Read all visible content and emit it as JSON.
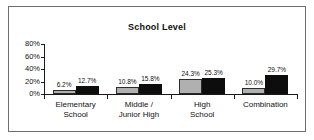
{
  "chart_data": {
    "type": "bar",
    "title": "School Level",
    "xlabel": "",
    "ylabel": "",
    "ylim": [
      0,
      80
    ],
    "grid": false,
    "legend": "none",
    "ytick_labels": [
      "80%",
      "60%",
      "40%",
      "20%",
      "0%"
    ],
    "ytick_values": [
      80,
      60,
      40,
      20,
      0
    ],
    "categories": [
      [
        "Elementary",
        "School"
      ],
      [
        "Middle /",
        "Junior High"
      ],
      [
        "High",
        "School"
      ],
      [
        "Combination"
      ]
    ],
    "category_labels": [
      "Elementary School",
      "Middle / Junior High",
      "High School",
      "Combination"
    ],
    "series": [
      {
        "name": "series-a",
        "color": "#b0b0b0",
        "values": [
          6.2,
          10.8,
          24.3,
          10.0
        ],
        "labels": [
          "6.2%",
          "10.8%",
          "24.3%",
          "10.0%"
        ]
      },
      {
        "name": "series-b",
        "color": "#0d0d0d",
        "values": [
          12.7,
          15.8,
          25.3,
          29.7
        ],
        "labels": [
          "12.7%",
          "15.8%",
          "25.3%",
          "29.7%"
        ]
      }
    ]
  }
}
